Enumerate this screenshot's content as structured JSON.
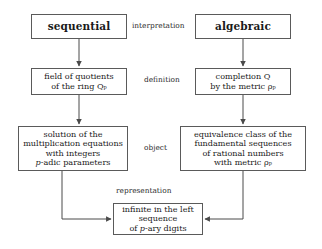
{
  "diagram": {
    "background_color": "#ffffff",
    "line_color": "#5a5a5a",
    "text_color": "#1a1a1a",
    "nodes": [
      {
        "id": "sequential",
        "label": "sequential",
        "style": "heading"
      },
      {
        "id": "algebraic",
        "label": "algebraic",
        "style": "heading"
      },
      {
        "id": "field",
        "label": "field of quotients\nof the ring Qₚ",
        "style": "body"
      },
      {
        "id": "completion",
        "label": "completion Q\nby the metric ρₚ",
        "style": "body"
      },
      {
        "id": "solution",
        "label": "solution of the\nmultiplication equations\nwith integers\np-adic parameters",
        "style": "body"
      },
      {
        "id": "equivalence",
        "label": "equivalence class of the\nfundamental sequences\nof rational numbers\nwith metric ρₚ",
        "style": "body"
      },
      {
        "id": "infinite",
        "label": "infinite in the left\nsequence\nof p-ary digits",
        "style": "body"
      }
    ],
    "edge_labels": [
      {
        "id": "interpretation",
        "label": "interpretation"
      },
      {
        "id": "definition",
        "label": "definition"
      },
      {
        "id": "object",
        "label": "object"
      },
      {
        "id": "representation",
        "label": "representation"
      }
    ],
    "edges": [
      {
        "from": "sequential",
        "to": "field",
        "arrow": "down"
      },
      {
        "from": "algebraic",
        "to": "completion",
        "arrow": "down"
      },
      {
        "from": "field",
        "to": "solution",
        "arrow": "down"
      },
      {
        "from": "completion",
        "to": "equivalence",
        "arrow": "down"
      },
      {
        "from": "solution",
        "to": "infinite",
        "arrow": "elbow-right"
      },
      {
        "from": "equivalence",
        "to": "infinite",
        "arrow": "elbow-left"
      }
    ]
  }
}
